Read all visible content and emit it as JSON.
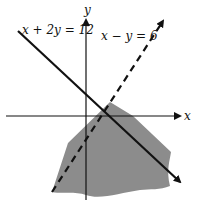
{
  "diagram": {
    "type": "linear-inequality-graph",
    "axes": {
      "x_label": "x",
      "y_label": "y"
    },
    "lines": [
      {
        "equation_label": "x + 2y = 12",
        "style": "solid"
      },
      {
        "equation_label": "x − y = 6",
        "style": "dashed"
      }
    ],
    "shaded_region": {
      "color": "#8c8c8c",
      "description": "region below x + 2y = 12 and right of x - y = 6"
    },
    "colors": {
      "line": "#111111",
      "shade": "#8c8c8c",
      "background": "#ffffff"
    }
  }
}
